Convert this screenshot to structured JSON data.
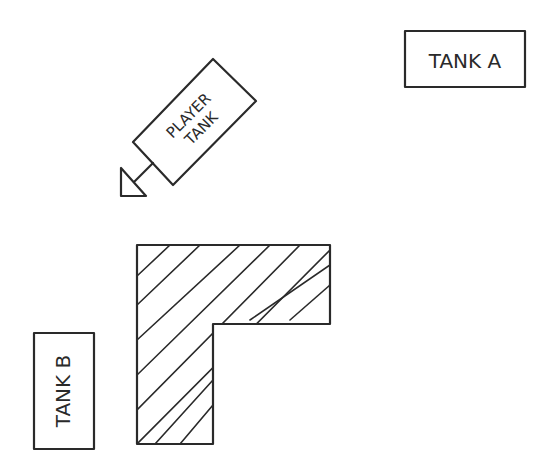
{
  "diagram": {
    "tank_a": {
      "label": "TANK A"
    },
    "player_tank": {
      "label_line1": "PLAYER",
      "label_line2": "TANK"
    },
    "tank_b": {
      "label": "TANK B"
    },
    "obstacle": {
      "shape": "L-shaped wall",
      "fill": "diagonal hatch"
    },
    "colors": {
      "ink": "#2a2a2a",
      "background": "#ffffff"
    }
  }
}
